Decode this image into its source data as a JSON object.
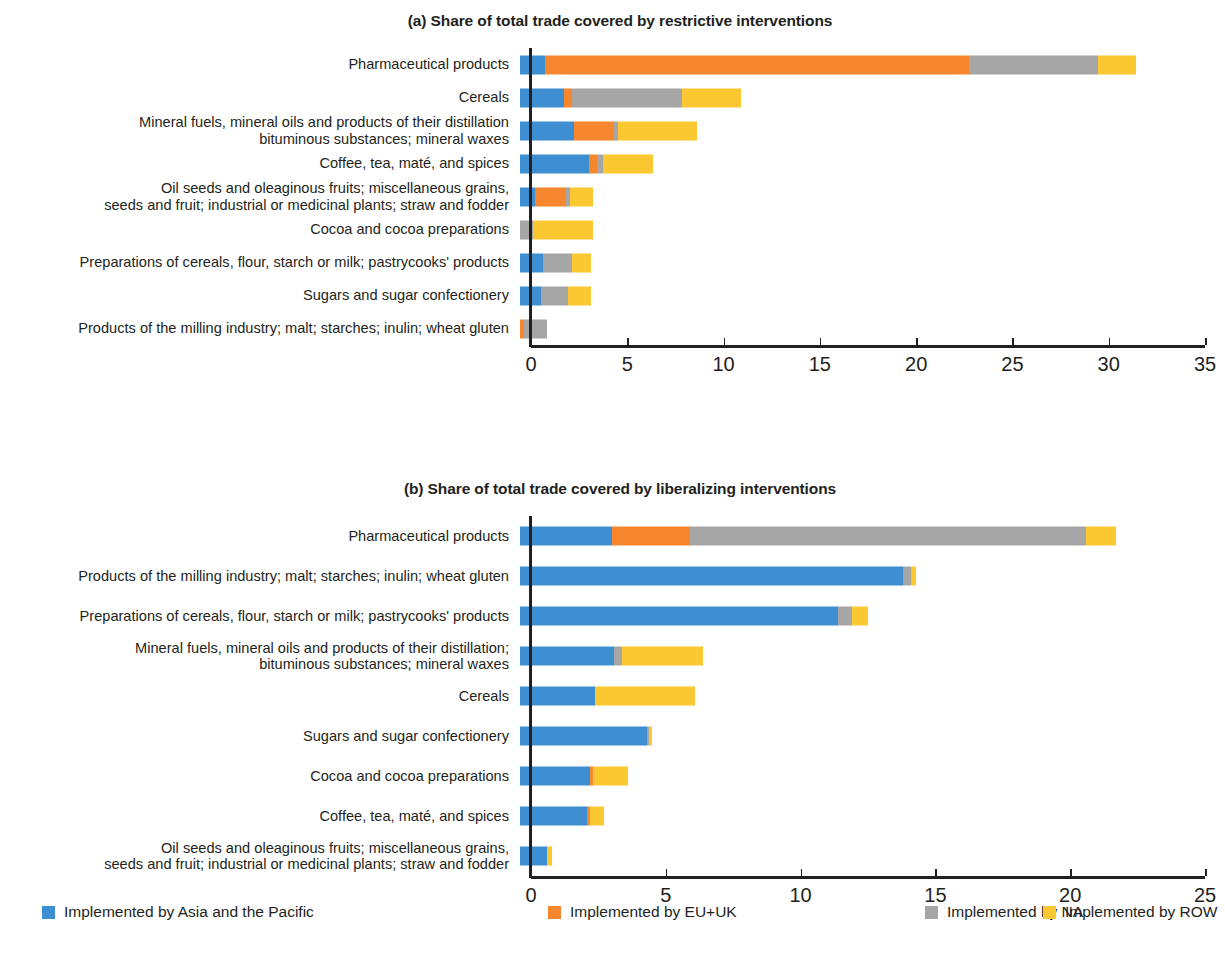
{
  "legend": {
    "items": [
      {
        "label": "Implemented by Asia and the Pacific",
        "color": "#3d8fd1",
        "key": "asia_pacific"
      },
      {
        "label": "Implemented by EU+UK",
        "color": "#f7872e",
        "key": "eu_uk"
      },
      {
        "label": "Implemented by NA",
        "color": "#a6a6a6",
        "key": "na"
      },
      {
        "label": "Implemented by ROW",
        "color": "#fcc831",
        "key": "row"
      }
    ],
    "offsets_px": [
      42,
      548,
      925,
      1043
    ]
  },
  "colors": {
    "asia_pacific": "#3d8fd1",
    "eu_uk": "#f7872e",
    "na": "#a6a6a6",
    "row": "#fcc831",
    "axis": "#231f20",
    "text": "#231f20",
    "background": "#ffffff"
  },
  "chart_data": [
    {
      "id": "panel-a",
      "type": "bar",
      "orientation": "horizontal",
      "stacked": true,
      "title": "(a) Share of total trade covered by restrictive interventions",
      "xlabel": "",
      "ylabel": "",
      "xlim": [
        0,
        35
      ],
      "xticks": [
        0,
        5,
        10,
        15,
        20,
        25,
        30,
        35
      ],
      "xtick_labels": [
        "0",
        "5",
        "10",
        "15",
        "20",
        "25",
        "30",
        "35"
      ],
      "grid": false,
      "legend_position": "bottom",
      "categories": [
        "Pharmaceutical products",
        "Cereals",
        "Mineral fuels, mineral oils and products of their distillation\nbituminous substances; mineral waxes",
        "Coffee, tea, maté, and spices",
        "Oil seeds and oleaginous fruits; miscellaneous grains,\nseeds and fruit; industrial or medicinal plants; straw and fodder",
        "Cocoa and cocoa preparations",
        "Preparations of cereals, flour, starch or milk; pastrycooks' products",
        "Sugars and sugar confectionery",
        "Products of the milling industry; malt; starches; inulin; wheat gluten"
      ],
      "series": [
        {
          "name": "Implemented by Asia and the Pacific",
          "key": "asia_pacific",
          "values": [
            1.3,
            2.3,
            2.8,
            3.6,
            0.8,
            0.0,
            1.2,
            1.1,
            0.0
          ]
        },
        {
          "name": "Implemented by EU+UK",
          "key": "eu_uk",
          "values": [
            22.0,
            0.4,
            2.1,
            0.4,
            1.6,
            0.0,
            0.0,
            0.0,
            0.2
          ]
        },
        {
          "name": "Implemented by NA",
          "key": "na",
          "values": [
            6.7,
            5.7,
            0.2,
            0.3,
            0.2,
            0.7,
            1.5,
            1.4,
            1.2
          ]
        },
        {
          "name": "Implemented by ROW",
          "key": "row",
          "values": [
            2.0,
            3.1,
            4.1,
            2.6,
            1.2,
            3.1,
            1.0,
            1.2,
            0.0
          ]
        }
      ],
      "totals": [
        32.0,
        11.5,
        9.2,
        6.9,
        3.8,
        3.8,
        3.7,
        3.7,
        1.4
      ]
    },
    {
      "id": "panel-b",
      "type": "bar",
      "orientation": "horizontal",
      "stacked": true,
      "title": "(b) Share of total trade covered by liberalizing interventions",
      "xlabel": "",
      "ylabel": "",
      "xlim": [
        0,
        25
      ],
      "xticks": [
        0,
        5,
        10,
        15,
        20,
        25
      ],
      "xtick_labels": [
        "0",
        "5",
        "10",
        "15",
        "20",
        "25"
      ],
      "grid": false,
      "legend_position": "bottom",
      "categories": [
        "Pharmaceutical products",
        "Products of the milling industry; malt; starches; inulin; wheat gluten",
        "Preparations of cereals, flour, starch or milk; pastrycooks' products",
        "Mineral fuels, mineral oils and products of their distillation;\nbituminous substances; mineral waxes",
        "Cereals",
        "Sugars and sugar confectionery",
        "Cocoa and cocoa preparations",
        "Coffee, tea, maté, and spices",
        "Oil seeds and oleaginous fruits; miscellaneous grains,\nseeds and fruit; industrial or medicinal plants; straw and fodder"
      ],
      "series": [
        {
          "name": "Implemented by Asia and the Pacific",
          "key": "asia_pacific",
          "values": [
            3.4,
            14.2,
            11.8,
            3.5,
            2.8,
            4.7,
            2.6,
            2.5,
            1.0
          ]
        },
        {
          "name": "Implemented by EU+UK",
          "key": "eu_uk",
          "values": [
            2.9,
            0.0,
            0.0,
            0.0,
            0.0,
            0.0,
            0.1,
            0.1,
            0.0
          ]
        },
        {
          "name": "Implemented by NA",
          "key": "na",
          "values": [
            14.7,
            0.3,
            0.5,
            0.3,
            0.0,
            0.1,
            0.0,
            0.0,
            0.0
          ]
        },
        {
          "name": "Implemented by ROW",
          "key": "row",
          "values": [
            1.1,
            0.2,
            0.6,
            3.0,
            3.7,
            0.1,
            1.3,
            0.5,
            0.2
          ]
        }
      ],
      "totals": [
        22.1,
        14.7,
        12.9,
        6.8,
        6.5,
        4.9,
        4.0,
        3.1,
        1.2
      ]
    }
  ]
}
